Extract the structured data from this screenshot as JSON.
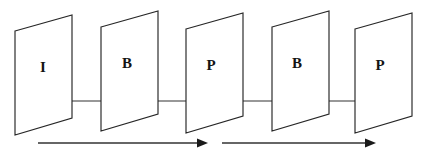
{
  "diagram": {
    "type": "frame-sequence-diagram",
    "colors": {
      "stroke": "#262626",
      "label": "#141414",
      "arrow": "#1a1a1a",
      "faint_line": "#777777",
      "background": "#ffffff"
    },
    "frames": [
      {
        "id": "frame-1",
        "label": "I",
        "name": "intra-frame",
        "center_x": 43,
        "order": 1
      },
      {
        "id": "frame-2",
        "label": "B",
        "name": "bidirectional-frame",
        "center_x": 127,
        "order": 2
      },
      {
        "id": "frame-3",
        "label": "P",
        "name": "predicted-frame",
        "center_x": 211,
        "order": 3
      },
      {
        "id": "frame-4",
        "label": "B",
        "name": "bidirectional-frame",
        "center_x": 297,
        "order": 4
      },
      {
        "id": "frame-5",
        "label": "P",
        "name": "predicted-frame",
        "center_x": 380,
        "order": 5
      }
    ],
    "prediction_arrows": [
      {
        "id": "arrow-i-to-b1",
        "name": "forward-prediction-arrow",
        "direction": "right",
        "from": "I",
        "to": "B"
      },
      {
        "id": "arrow-p1-to-b1",
        "name": "backward-prediction-arrow",
        "direction": "left",
        "from": "P",
        "to": "B"
      },
      {
        "id": "arrow-p1-to-b2",
        "name": "forward-prediction-arrow",
        "direction": "right",
        "from": "P",
        "to": "B"
      },
      {
        "id": "arrow-p2-to-b2",
        "name": "backward-prediction-arrow",
        "direction": "left",
        "from": "P",
        "to": "B"
      }
    ],
    "order_arrows": [
      {
        "id": "order-arrow-1",
        "name": "display-order-arrow",
        "direction": "right"
      },
      {
        "id": "order-arrow-2",
        "name": "display-order-arrow",
        "direction": "right"
      }
    ]
  }
}
